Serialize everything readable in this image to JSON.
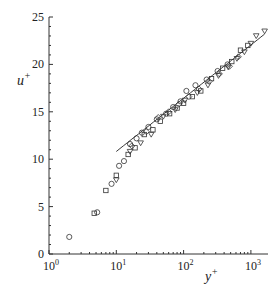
{
  "chart_data": {
    "type": "scatter",
    "title": "",
    "xlabel": "y+",
    "ylabel": "u+",
    "xscale": "log",
    "xlim": [
      1,
      1800
    ],
    "ylim": [
      0,
      25
    ],
    "x_ticks": [
      {
        "v": 1,
        "label": "10",
        "exp": "0"
      },
      {
        "v": 10,
        "label": "10",
        "exp": "1"
      },
      {
        "v": 100,
        "label": "10",
        "exp": "2"
      },
      {
        "v": 1000,
        "label": "10",
        "exp": "3"
      }
    ],
    "y_ticks": [
      0,
      5,
      10,
      15,
      20,
      25
    ],
    "grid": false,
    "legend": "none",
    "reference_line": {
      "name": "log law",
      "kappa": 0.41,
      "B": 5.2,
      "x_range": [
        10,
        1600
      ]
    },
    "series": [
      {
        "name": "circles",
        "marker": "circle",
        "points": [
          [
            2,
            1.8
          ],
          [
            5.2,
            4.4
          ],
          [
            8.5,
            7.4
          ],
          [
            11,
            9.3
          ],
          [
            13,
            9.8
          ],
          [
            16,
            11.6
          ],
          [
            20,
            12.2
          ],
          [
            24,
            12.8
          ],
          [
            30,
            13.4
          ],
          [
            40,
            14.2
          ],
          [
            55,
            14.8
          ],
          [
            70,
            15.5
          ],
          [
            90,
            16.1
          ],
          [
            110,
            17.2
          ],
          [
            150,
            17.8
          ],
          [
            220,
            18.4
          ],
          [
            320,
            19.3
          ],
          [
            450,
            20.0
          ]
        ]
      },
      {
        "name": "squares",
        "marker": "square",
        "points": [
          [
            4.7,
            4.3
          ],
          [
            7,
            6.7
          ],
          [
            10,
            8.3
          ],
          [
            15,
            10.5
          ],
          [
            19,
            11.2
          ],
          [
            26,
            12.6
          ],
          [
            35,
            13.1
          ],
          [
            45,
            14.0
          ],
          [
            62,
            14.8
          ],
          [
            80,
            15.4
          ],
          [
            100,
            15.9
          ],
          [
            135,
            16.6
          ],
          [
            180,
            17.2
          ],
          [
            260,
            18.5
          ],
          [
            380,
            19.6
          ],
          [
            520,
            20.3
          ],
          [
            700,
            21.5
          ],
          [
            900,
            22.0
          ]
        ]
      },
      {
        "name": "diamonds",
        "marker": "diamond",
        "points": [
          [
            17,
            11.4
          ],
          [
            28,
            12.9
          ],
          [
            42,
            14.4
          ],
          [
            60,
            15.0
          ],
          [
            85,
            15.8
          ],
          [
            120,
            16.6
          ],
          [
            170,
            17.4
          ],
          [
            240,
            18.2
          ],
          [
            340,
            19.0
          ],
          [
            480,
            19.8
          ],
          [
            650,
            20.8
          ]
        ]
      },
      {
        "name": "triangles",
        "marker": "triangle-down",
        "points": [
          [
            10,
            7.8
          ],
          [
            16,
            10.8
          ],
          [
            23,
            11.7
          ],
          [
            33,
            12.6
          ],
          [
            50,
            14.5
          ],
          [
            75,
            15.2
          ],
          [
            105,
            16.2
          ],
          [
            160,
            17.0
          ],
          [
            230,
            17.8
          ],
          [
            330,
            18.8
          ],
          [
            460,
            19.7
          ],
          [
            620,
            20.6
          ],
          [
            800,
            21.3
          ],
          [
            1000,
            22.2
          ],
          [
            1200,
            23.0
          ],
          [
            1600,
            23.5
          ]
        ]
      }
    ]
  }
}
